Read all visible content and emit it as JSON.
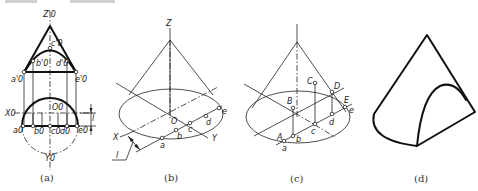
{
  "figure": {
    "panels": [
      {
        "id": "a",
        "caption": "(a)",
        "labels": {
          "z_axis": "Z'0",
          "apex": "c'0",
          "b_front": "b'0",
          "d_front": "d'0",
          "a_front": "a'0",
          "e_front": "e'0",
          "center": "O0",
          "x_axis": "X0",
          "y_axis": "Y0",
          "a_top": "a0",
          "b_top": "b0",
          "c_top": "c0",
          "d_top": "d0",
          "e_top": "e0",
          "dimension": "l"
        }
      },
      {
        "id": "b",
        "caption": "(b)",
        "labels": {
          "z_axis": "Z",
          "origin": "O",
          "x_axis": "X",
          "y_axis": "Y",
          "points": [
            "a",
            "b",
            "c",
            "d",
            "e"
          ],
          "dimension": "l"
        }
      },
      {
        "id": "c",
        "caption": "(c)",
        "labels": {
          "upper_points": [
            "A",
            "B",
            "C",
            "D",
            "E"
          ],
          "lower_points": [
            "a",
            "b",
            "c",
            "d",
            "e"
          ]
        }
      },
      {
        "id": "d",
        "caption": "(d)",
        "labels": {}
      }
    ]
  },
  "colors": {
    "line": "#111111",
    "background": "#ffffff",
    "caption": "#333333"
  }
}
